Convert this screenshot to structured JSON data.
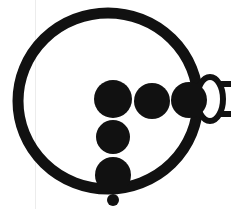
{
  "figure": {
    "domain": "Diagram",
    "title": "",
    "background_color": "#ffffff",
    "ink_color": "#111111",
    "scan_artifact_color": "#ececec",
    "canvas": {
      "width": 231,
      "height": 209
    },
    "elements": {
      "ring": {
        "name": "outer-ring",
        "shape": "ellipse-outline",
        "cx": 108,
        "cy": 101,
        "rx": 90,
        "ry": 88,
        "stroke_width": 11
      },
      "horizontal_dots": {
        "name": "horizontal-dot-row",
        "count": 3,
        "shape": "filled-circle",
        "dots": [
          {
            "label": "dot-h1",
            "cx": 113,
            "cy": 99,
            "r": 19
          },
          {
            "label": "dot-h2",
            "cx": 152,
            "cy": 101,
            "r": 18
          },
          {
            "label": "dot-h3",
            "cx": 189,
            "cy": 100,
            "r": 18
          }
        ]
      },
      "vertical_dots": {
        "name": "vertical-dot-column",
        "count": 2,
        "shape": "filled-circle",
        "dots": [
          {
            "label": "dot-v1",
            "cx": 113,
            "cy": 137,
            "r": 17
          },
          {
            "label": "dot-v2",
            "cx": 113,
            "cy": 175,
            "r": 18
          }
        ]
      },
      "small_dot": {
        "name": "small-bottom-dot",
        "shape": "filled-circle",
        "cx": 113,
        "cy": 200,
        "r": 6
      },
      "side_ellipse": {
        "name": "side-ellipse-outline",
        "shape": "ellipse-outline",
        "cx": 210,
        "cy": 99,
        "rx": 13,
        "ry": 22,
        "stroke_width": 6
      },
      "tail_lines": {
        "name": "tail-lines",
        "count": 2,
        "shape": "horizontal-line",
        "lines": [
          {
            "label": "tail-line-top",
            "x1": 220,
            "y1": 84,
            "x2": 231,
            "y2": 84,
            "stroke_width": 6
          },
          {
            "label": "tail-line-bottom",
            "x1": 220,
            "y1": 114,
            "x2": 231,
            "y2": 114,
            "stroke_width": 6
          }
        ]
      },
      "scan_edge": {
        "name": "scan-page-edge",
        "shape": "vertical-line",
        "x": 35
      }
    }
  }
}
